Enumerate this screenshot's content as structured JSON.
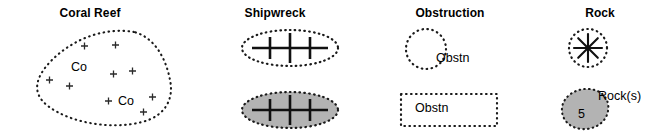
{
  "legend": {
    "title": "Nautical chart symbols legend",
    "columns": [
      {
        "key": "coral-reef",
        "header": "Coral Reef",
        "symbols": [
          {
            "key": "coral-reef-area",
            "style": "dotted-outline-blob",
            "fill": "none",
            "inner_labels": [
              "Co",
              "Co"
            ],
            "inner_marks": "plus",
            "mark_count": 10,
            "side_label": ""
          }
        ]
      },
      {
        "key": "shipwreck",
        "header": "Shipwreck",
        "symbols": [
          {
            "key": "shipwreck-outline",
            "style": "dotted-ellipse-wreck",
            "fill": "none",
            "masts": 3,
            "side_label": ""
          },
          {
            "key": "shipwreck-filled",
            "style": "dotted-ellipse-wreck",
            "fill": "gray",
            "masts": 3,
            "side_label": ""
          }
        ]
      },
      {
        "key": "obstruction",
        "header": "Obstruction",
        "symbols": [
          {
            "key": "obstruction-circle",
            "style": "dotted-circle",
            "fill": "none",
            "side_label": "Obstn"
          },
          {
            "key": "obstruction-rectangle",
            "style": "dotted-rectangle",
            "fill": "none",
            "inner_label": "Obstn"
          }
        ]
      },
      {
        "key": "rock",
        "header": "Rock",
        "symbols": [
          {
            "key": "rock-star",
            "style": "dotted-circle-asterisk",
            "fill": "none",
            "rays": 8,
            "side_label": ""
          },
          {
            "key": "rock-blob",
            "style": "dotted-blob",
            "fill": "gray",
            "inner_label": "5",
            "side_label": "Rock(s)"
          }
        ]
      }
    ],
    "colors": {
      "ink": "#000000",
      "gray_fill": "#b3b3b3",
      "background": "#ffffff"
    }
  }
}
